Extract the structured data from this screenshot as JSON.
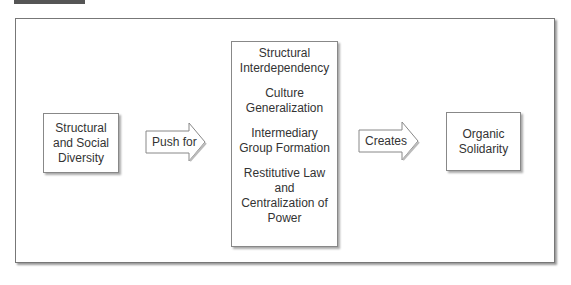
{
  "diagram": {
    "boxes": [
      {
        "id": "structural-social-diversity",
        "lines": [
          "Structural",
          "and Social",
          "Diversity"
        ]
      },
      {
        "id": "organic-solidarity",
        "lines": [
          "Organic",
          "Solidarity"
        ]
      }
    ],
    "middle_box": {
      "items": [
        {
          "lines": [
            "Structural",
            "Interdependency"
          ]
        },
        {
          "lines": [
            "Culture",
            "Generalization"
          ]
        },
        {
          "lines": [
            "Intermediary",
            "Group Formation"
          ]
        },
        {
          "lines": [
            "Restitutive Law",
            "and",
            "Centralization of",
            "Power"
          ]
        }
      ]
    },
    "arrows": [
      {
        "label": "Push for"
      },
      {
        "label": "Creates"
      }
    ],
    "colors": {
      "border": "#888888",
      "header_bar": "#555555",
      "text": "#333333"
    }
  }
}
